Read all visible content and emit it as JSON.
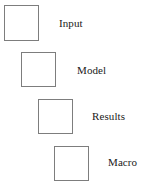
{
  "diagram": {
    "type": "staircase-flow",
    "background_color": "#ffffff",
    "box_border_color": "#7d7d7d",
    "box_fill_color": "#ffffff",
    "label_color": "#1a1a1a",
    "stages": [
      {
        "label": "Input",
        "box_name": "input-box",
        "label_name": "input-label"
      },
      {
        "label": "Model",
        "box_name": "model-box",
        "label_name": "model-label"
      },
      {
        "label": "Results",
        "box_name": "results-box",
        "label_name": "results-label"
      },
      {
        "label": "Macro",
        "box_name": "macro-box",
        "label_name": "macro-label"
      }
    ]
  }
}
